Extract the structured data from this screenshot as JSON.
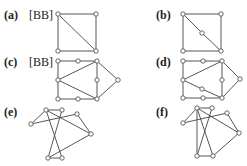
{
  "figure": {
    "panels": [
      {
        "id": "a",
        "label": "(a)",
        "ref": "[BB]",
        "label_pos": [
          4,
          9
        ],
        "ref_pos": [
          29,
          9
        ],
        "nodes": [
          [
            58,
            14
          ],
          [
            96,
            14
          ],
          [
            58,
            51
          ],
          [
            96,
            51
          ]
        ],
        "edges": [
          [
            0,
            1
          ],
          [
            0,
            2
          ],
          [
            1,
            3
          ],
          [
            2,
            3
          ],
          [
            0,
            3
          ]
        ]
      },
      {
        "id": "b",
        "label": "(b)",
        "ref": "",
        "label_pos": [
          156,
          9
        ],
        "ref_pos": null,
        "nodes": [
          [
            183,
            14
          ],
          [
            221,
            14
          ],
          [
            183,
            51
          ],
          [
            221,
            51
          ],
          [
            202,
            33
          ]
        ],
        "edges": [
          [
            0,
            1
          ],
          [
            0,
            2
          ],
          [
            1,
            3
          ],
          [
            2,
            3
          ],
          [
            0,
            4
          ],
          [
            4,
            3
          ]
        ]
      },
      {
        "id": "c",
        "label": "(c)",
        "ref": "[BB]",
        "label_pos": [
          4,
          56
        ],
        "ref_pos": [
          29,
          56
        ],
        "nodes": [
          [
            58,
            61
          ],
          [
            78,
            61
          ],
          [
            97,
            61
          ],
          [
            58,
            80
          ],
          [
            97,
            80
          ],
          [
            118,
            80
          ],
          [
            58,
            99
          ],
          [
            78,
            99
          ],
          [
            97,
            99
          ]
        ],
        "edges": [
          [
            0,
            1
          ],
          [
            1,
            2
          ],
          [
            0,
            3
          ],
          [
            3,
            6
          ],
          [
            2,
            4
          ],
          [
            4,
            8
          ],
          [
            3,
            2
          ],
          [
            3,
            8
          ],
          [
            2,
            5
          ],
          [
            5,
            8
          ],
          [
            6,
            7
          ],
          [
            7,
            8
          ]
        ]
      },
      {
        "id": "d",
        "label": "(d)",
        "ref": "",
        "label_pos": [
          156,
          56
        ],
        "ref_pos": null,
        "nodes": [
          [
            183,
            61
          ],
          [
            203,
            61
          ],
          [
            222,
            61
          ],
          [
            183,
            80
          ],
          [
            222,
            80
          ],
          [
            240,
            79
          ],
          [
            183,
            98
          ],
          [
            203,
            98
          ],
          [
            222,
            98
          ],
          [
            202,
            89
          ]
        ],
        "edges": [
          [
            0,
            1
          ],
          [
            1,
            2
          ],
          [
            0,
            3
          ],
          [
            3,
            6
          ],
          [
            2,
            4
          ],
          [
            4,
            8
          ],
          [
            3,
            2
          ],
          [
            3,
            9
          ],
          [
            9,
            8
          ],
          [
            2,
            5
          ],
          [
            5,
            8
          ],
          [
            6,
            7
          ],
          [
            7,
            8
          ]
        ]
      },
      {
        "id": "e",
        "label": "(e)",
        "ref": "",
        "label_pos": [
          4,
          106
        ],
        "ref_pos": null,
        "nodes": [
          [
            46,
            110
          ],
          [
            62,
            110
          ],
          [
            77,
            114
          ],
          [
            31,
            124
          ],
          [
            91,
            134
          ],
          [
            48,
            158
          ],
          [
            62,
            158
          ]
        ],
        "edges": [
          [
            0,
            1
          ],
          [
            0,
            3
          ],
          [
            3,
            2
          ],
          [
            0,
            4
          ],
          [
            2,
            4
          ],
          [
            0,
            6
          ],
          [
            1,
            5
          ],
          [
            5,
            6
          ],
          [
            5,
            4
          ]
        ]
      },
      {
        "id": "f",
        "label": "(f)",
        "ref": "",
        "label_pos": [
          156,
          106
        ],
        "ref_pos": null,
        "nodes": [
          [
            197,
            108
          ],
          [
            212,
            108
          ],
          [
            227,
            113
          ],
          [
            183,
            123
          ],
          [
            239,
            133
          ],
          [
            197,
            156
          ],
          [
            213,
            156
          ]
        ],
        "edges": [
          [
            0,
            1
          ],
          [
            0,
            3
          ],
          [
            3,
            2
          ],
          [
            0,
            4
          ],
          [
            2,
            4
          ],
          [
            0,
            5
          ],
          [
            0,
            6
          ],
          [
            1,
            5
          ],
          [
            5,
            6
          ],
          [
            6,
            4
          ]
        ]
      }
    ]
  }
}
